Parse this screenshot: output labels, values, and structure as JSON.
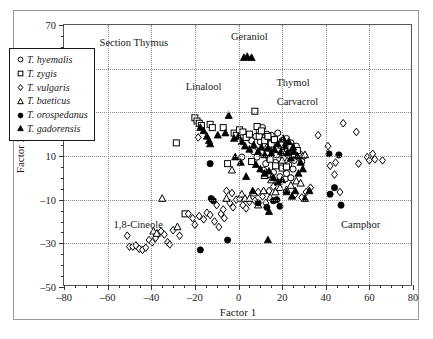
{
  "chart_data": {
    "type": "scatter",
    "title": "",
    "xlabel": "Factor 1",
    "ylabel": "Factor 2",
    "xlim": [
      -80,
      80
    ],
    "ylim": [
      -50,
      70
    ],
    "xticks": [
      -80,
      -60,
      -40,
      -20,
      0,
      20,
      40,
      60,
      80
    ],
    "yticks": [
      -50,
      -30,
      -10,
      10,
      30,
      50,
      70
    ],
    "xticklabels": [
      "–80",
      "–60",
      "–40",
      "–20",
      "0",
      "20",
      "40",
      "60",
      "80"
    ],
    "yticklabels": [
      "–50",
      "–30",
      "–10",
      "10",
      "30",
      "50",
      "70"
    ],
    "grid": true,
    "legend_position": "upper-left-inside",
    "annotations": [
      {
        "text": "Section Thymus",
        "x": -48,
        "y": 62
      },
      {
        "text": "Geraniol",
        "x": 5,
        "y": 65
      },
      {
        "text": "Linalool",
        "x": -16,
        "y": 42
      },
      {
        "text": "Thymol",
        "x": 25,
        "y": 44
      },
      {
        "text": "Carvacrol",
        "x": 27,
        "y": 35
      },
      {
        "text": "1,8-Cineole",
        "x": -46,
        "y": -21
      },
      {
        "text": "Camphor",
        "x": 56,
        "y": -21
      }
    ],
    "series": [
      {
        "name": "T. hyemalis",
        "marker": "circle-open",
        "points": [
          [
            1.5,
            9.5
          ],
          [
            6.0,
            17.0
          ],
          [
            8.0,
            19.0
          ],
          [
            9.5,
            21.5
          ],
          [
            11.0,
            23.0
          ],
          [
            10.0,
            16.5
          ],
          [
            12.0,
            18.5
          ],
          [
            13.5,
            14.0
          ],
          [
            14.5,
            16.0
          ],
          [
            15.5,
            12.0
          ],
          [
            16.5,
            13.5
          ],
          [
            17.5,
            10.5
          ],
          [
            18.5,
            14.5
          ],
          [
            19.5,
            11.5
          ],
          [
            20.5,
            9.0
          ],
          [
            21.5,
            12.5
          ],
          [
            22.5,
            15.0
          ],
          [
            23.5,
            10.0
          ],
          [
            24.5,
            13.0
          ],
          [
            25.5,
            8.0
          ],
          [
            17.0,
            7.0
          ],
          [
            19.0,
            6.0
          ],
          [
            21.0,
            4.5
          ],
          [
            14.0,
            9.0
          ],
          [
            12.5,
            6.5
          ],
          [
            10.5,
            11.5
          ],
          [
            8.5,
            9.5
          ],
          [
            7.0,
            12.0
          ],
          [
            13.0,
            20.0
          ],
          [
            15.0,
            19.5
          ],
          [
            16.0,
            17.5
          ],
          [
            18.0,
            20.5
          ],
          [
            20.0,
            17.0
          ],
          [
            22.0,
            18.0
          ],
          [
            24.0,
            16.0
          ],
          [
            26.0,
            12.0
          ],
          [
            27.5,
            9.5
          ],
          [
            29.0,
            7.5
          ],
          [
            23.0,
            6.0
          ],
          [
            25.0,
            4.0
          ],
          [
            11.5,
            3.5
          ],
          [
            13.5,
            1.5
          ],
          [
            16.0,
            2.5
          ],
          [
            19.0,
            0.5
          ],
          [
            21.5,
            -0.5
          ],
          [
            26.5,
            14.5
          ],
          [
            28.0,
            11.0
          ],
          [
            30.0,
            10.0
          ],
          [
            22.0,
            2.0
          ],
          [
            24.0,
            0.0
          ]
        ]
      },
      {
        "name": "T. zygis",
        "marker": "square-open",
        "points": [
          [
            -28.5,
            16.0
          ],
          [
            -20.0,
            27.5
          ],
          [
            -19.0,
            26.0
          ],
          [
            -18.0,
            25.0
          ],
          [
            -17.0,
            24.0
          ],
          [
            -13.0,
            24.5
          ],
          [
            -12.0,
            23.0
          ],
          [
            -7.0,
            23.0
          ],
          [
            -2.0,
            20.5
          ],
          [
            -1.0,
            19.5
          ],
          [
            0.5,
            22.0
          ],
          [
            2.0,
            21.0
          ],
          [
            3.5,
            18.5
          ],
          [
            5.0,
            20.0
          ],
          [
            7.5,
            30.5
          ],
          [
            8.5,
            23.5
          ],
          [
            9.5,
            19.0
          ],
          [
            10.5,
            21.5
          ],
          [
            12.0,
            17.0
          ],
          [
            13.5,
            19.0
          ],
          [
            15.0,
            15.5
          ],
          [
            16.5,
            17.5
          ],
          [
            18.0,
            13.0
          ],
          [
            19.5,
            15.0
          ],
          [
            21.0,
            11.5
          ],
          [
            22.5,
            13.5
          ],
          [
            24.0,
            14.0
          ],
          [
            25.5,
            11.0
          ],
          [
            27.0,
            12.5
          ],
          [
            20.0,
            4.5
          ],
          [
            22.0,
            5.0
          ],
          [
            17.0,
            5.5
          ],
          [
            -24.5,
            -16.5
          ],
          [
            -5.0,
            6.5
          ],
          [
            6.0,
            7.5
          ],
          [
            14.5,
            8.5
          ]
        ]
      },
      {
        "name": "T. vulgaris",
        "marker": "diamond-open",
        "points": [
          [
            -51.0,
            -26.5
          ],
          [
            -50.0,
            -31.5
          ],
          [
            -48.5,
            -31.5
          ],
          [
            -47.0,
            -31.0
          ],
          [
            -45.5,
            -32.5
          ],
          [
            -44.0,
            -33.0
          ],
          [
            -42.5,
            -32.0
          ],
          [
            -41.0,
            -28.5
          ],
          [
            -39.5,
            -29.5
          ],
          [
            -38.0,
            -27.5
          ],
          [
            -37.0,
            -25.5
          ],
          [
            -35.5,
            -24.5
          ],
          [
            -34.0,
            -26.0
          ],
          [
            -32.5,
            -29.5
          ],
          [
            -31.5,
            -30.5
          ],
          [
            -30.0,
            -24.0
          ],
          [
            -27.0,
            -26.5
          ],
          [
            -23.0,
            -16.5
          ],
          [
            -21.0,
            -18.5
          ],
          [
            -20.0,
            -21.5
          ],
          [
            -18.0,
            -17.5
          ],
          [
            -16.0,
            -19.0
          ],
          [
            -14.5,
            -16.0
          ],
          [
            -13.0,
            -17.0
          ],
          [
            -11.0,
            -20.0
          ],
          [
            -9.0,
            -22.5
          ],
          [
            -8.0,
            -16.5
          ],
          [
            -7.0,
            -14.5
          ],
          [
            -5.5,
            -6.0
          ],
          [
            -4.0,
            -11.5
          ],
          [
            -2.5,
            -13.5
          ],
          [
            -1.0,
            -10.0
          ],
          [
            0.5,
            -9.5
          ],
          [
            2.0,
            -12.5
          ],
          [
            3.5,
            -14.0
          ],
          [
            5.0,
            -11.0
          ],
          [
            -18.5,
            18.5
          ],
          [
            -6.5,
            -18.5
          ],
          [
            11.0,
            -8.5
          ],
          [
            12.5,
            -11.5
          ],
          [
            9.0,
            -6.5
          ],
          [
            14.0,
            -6.0
          ],
          [
            16.0,
            -4.0
          ],
          [
            29.0,
            -9.0
          ],
          [
            31.0,
            -6.5
          ],
          [
            33.0,
            -4.5
          ],
          [
            36.5,
            19.5
          ],
          [
            41.0,
            14.5
          ],
          [
            42.0,
            5.5
          ],
          [
            44.0,
            1.5
          ],
          [
            46.5,
            -6.5
          ],
          [
            48.0,
            25.0
          ],
          [
            54.0,
            21.0
          ],
          [
            55.0,
            6.5
          ],
          [
            59.0,
            9.5
          ],
          [
            60.0,
            8.0
          ],
          [
            61.5,
            11.0
          ],
          [
            62.5,
            8.5
          ],
          [
            66.0,
            8.0
          ],
          [
            44.5,
            7.0
          ],
          [
            26.0,
            -7.5
          ],
          [
            7.5,
            -10.5
          ],
          [
            -3.0,
            -7.0
          ],
          [
            -10.0,
            -12.5
          ]
        ]
      },
      {
        "name": "T. baeticus",
        "marker": "triangle-open",
        "points": [
          [
            -35.0,
            -9.5
          ],
          [
            -39.0,
            -24.5
          ],
          [
            -37.5,
            -25.5
          ],
          [
            -28.0,
            -22.5
          ],
          [
            -5.5,
            -9.5
          ],
          [
            -3.0,
            3.5
          ],
          [
            1.5,
            -7.5
          ],
          [
            3.0,
            -9.5
          ],
          [
            5.0,
            -9.5
          ],
          [
            7.0,
            -7.0
          ],
          [
            9.0,
            -12.5
          ],
          [
            11.5,
            -6.0
          ],
          [
            14.5,
            -9.0
          ],
          [
            17.0,
            -6.5
          ],
          [
            19.0,
            -4.5
          ],
          [
            22.0,
            -5.5
          ],
          [
            24.0,
            -3.5
          ],
          [
            26.5,
            -1.5
          ],
          [
            28.5,
            -2.5
          ],
          [
            30.5,
            10.5
          ],
          [
            20.0,
            8.0
          ],
          [
            15.0,
            -1.0
          ],
          [
            12.0,
            1.0
          ]
        ]
      },
      {
        "name": "T. orospedanus",
        "marker": "circle-filled",
        "points": [
          [
            -13.0,
            6.5
          ],
          [
            -12.5,
            -9.5
          ],
          [
            -11.5,
            -10.5
          ],
          [
            -17.5,
            -33.0
          ],
          [
            -5.0,
            -28.5
          ],
          [
            9.0,
            -11.5
          ],
          [
            16.0,
            -10.5
          ],
          [
            17.5,
            -10.0
          ],
          [
            19.0,
            -13.0
          ],
          [
            41.5,
            11.0
          ],
          [
            42.0,
            -7.5
          ],
          [
            46.0,
            10.5
          ],
          [
            47.0,
            -12.5
          ],
          [
            44.0,
            -4.5
          ],
          [
            13.0,
            -13.5
          ]
        ]
      },
      {
        "name": "T. gadorensis",
        "marker": "triangle-filled",
        "points": [
          [
            2.5,
            55.0
          ],
          [
            4.0,
            55.5
          ],
          [
            6.0,
            55.0
          ],
          [
            -17.5,
            23.0
          ],
          [
            -16.0,
            21.5
          ],
          [
            -14.5,
            19.0
          ],
          [
            -13.5,
            17.0
          ],
          [
            -13.0,
            15.5
          ],
          [
            -9.5,
            19.5
          ],
          [
            -6.0,
            20.5
          ],
          [
            -4.5,
            28.5
          ],
          [
            -2.0,
            18.0
          ],
          [
            0.0,
            19.0
          ],
          [
            1.5,
            16.5
          ],
          [
            3.0,
            14.5
          ],
          [
            5.0,
            13.0
          ],
          [
            7.0,
            15.0
          ],
          [
            9.0,
            12.0
          ],
          [
            10.5,
            14.0
          ],
          [
            12.0,
            10.5
          ],
          [
            13.5,
            13.5
          ],
          [
            15.0,
            11.0
          ],
          [
            16.5,
            13.0
          ],
          [
            18.0,
            15.5
          ],
          [
            19.5,
            12.0
          ],
          [
            21.0,
            14.5
          ],
          [
            22.5,
            11.5
          ],
          [
            24.0,
            9.0
          ],
          [
            25.5,
            12.0
          ],
          [
            27.0,
            10.0
          ],
          [
            28.5,
            7.0
          ],
          [
            10.0,
            4.0
          ],
          [
            12.0,
            2.0
          ],
          [
            14.0,
            3.0
          ],
          [
            16.0,
            0.0
          ],
          [
            18.0,
            -2.0
          ],
          [
            20.0,
            -1.0
          ],
          [
            22.0,
            -6.5
          ],
          [
            24.5,
            -8.5
          ],
          [
            26.0,
            -6.0
          ],
          [
            30.5,
            -9.5
          ],
          [
            32.5,
            -6.0
          ],
          [
            14.0,
            -15.5
          ],
          [
            13.5,
            -28.5
          ],
          [
            6.5,
            -6.0
          ],
          [
            8.0,
            6.0
          ],
          [
            3.5,
            0.5
          ],
          [
            1.0,
            7.0
          ],
          [
            -1.5,
            9.5
          ],
          [
            20.5,
            18.0
          ],
          [
            23.0,
            16.5
          ],
          [
            25.0,
            14.0
          ],
          [
            29.5,
            4.0
          ],
          [
            27.5,
            2.0
          ]
        ]
      }
    ]
  },
  "legend": {
    "items": [
      {
        "label": "T. hyemalis",
        "marker": "circle-open"
      },
      {
        "label": "T. zygis",
        "marker": "square-open"
      },
      {
        "label": "T. vulgaris",
        "marker": "diamond-open"
      },
      {
        "label": "T. baeticus",
        "marker": "triangle-open"
      },
      {
        "label": "T. orospedanus",
        "marker": "circle-filled"
      },
      {
        "label": "T. gadorensis",
        "marker": "triangle-filled"
      }
    ]
  }
}
